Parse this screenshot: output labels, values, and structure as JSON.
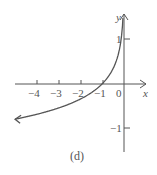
{
  "chart_data": {
    "type": "line",
    "title": "",
    "caption": "(d)",
    "xlabel": "x",
    "ylabel": "y",
    "function": "y = -ln(-x)",
    "x_ticks": [
      -4,
      -3,
      -2,
      -1,
      0
    ],
    "x_tick_labels": [
      "−4",
      "−3",
      "−2",
      "−1",
      "0"
    ],
    "y_ticks": [
      1,
      -1
    ],
    "y_tick_labels": [
      "1",
      "−1"
    ],
    "xlim": [
      -5,
      0.5
    ],
    "ylim": [
      -1.6,
      3.2
    ],
    "grid": false,
    "asymptote": "x = 0",
    "series": [
      {
        "name": "curve",
        "x": [
          -5,
          -4,
          -3,
          -2,
          -1,
          -0.5,
          -0.2,
          -0.1,
          -0.05
        ],
        "y": [
          -1.61,
          -1.39,
          -1.1,
          -0.69,
          0,
          0.69,
          1.61,
          2.3,
          3.0
        ]
      }
    ],
    "colors": {
      "axis": "#555555",
      "curve": "#555555"
    }
  }
}
